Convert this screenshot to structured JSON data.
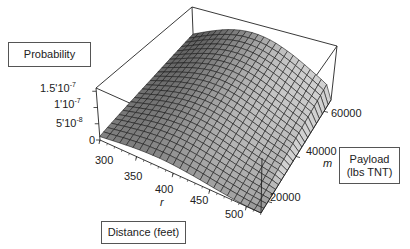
{
  "chart_data": {
    "type": "surface3d",
    "title": "",
    "xlabel": "Distance (feet)",
    "x_symbol": "r",
    "ylabel": "Payload (lbs TNT)",
    "y_symbol": "m",
    "zlabel": "Probability",
    "x_range": [
      300,
      520
    ],
    "y_range": [
      15000,
      65000
    ],
    "z_range": [
      0,
      1.6e-07
    ],
    "x_ticks": [
      300,
      350,
      400,
      450,
      500
    ],
    "y_ticks": [
      20000,
      40000,
      60000
    ],
    "z_ticks": [
      {
        "value": 0,
        "label": "0"
      },
      {
        "value": 5e-08,
        "label": "5'10",
        "exp": "-8"
      },
      {
        "value": 1e-07,
        "label": "1'10",
        "exp": "-7"
      },
      {
        "value": 1.5e-07,
        "label": "1.5'10",
        "exp": "-7"
      }
    ],
    "grid_resolution": [
      24,
      24
    ],
    "surface_description": "Dome-shaped probability surface; peaks near r≈380 ft at high payload (~1.4e-7), falls toward 0 at r=300 and r=520, lower at small payloads (~2e-8 at m=15000)",
    "sample_points": [
      {
        "r": 300,
        "m": 15000,
        "p": 1e-08
      },
      {
        "r": 380,
        "m": 15000,
        "p": 3.5e-08
      },
      {
        "r": 520,
        "m": 15000,
        "p": 0.0
      },
      {
        "r": 300,
        "m": 65000,
        "p": 6e-08
      },
      {
        "r": 380,
        "m": 65000,
        "p": 1.4e-07
      },
      {
        "r": 450,
        "m": 65000,
        "p": 1.2e-07
      },
      {
        "r": 520,
        "m": 65000,
        "p": 5.5e-08
      }
    ],
    "box": true,
    "grid": false,
    "legend": null
  },
  "labels": {
    "probability": "Probability",
    "distance": "Distance (feet)",
    "payload_line1": "Payload",
    "payload_line2": "(lbs TNT)",
    "r_symbol": "r",
    "m_symbol": "m"
  },
  "ticks": {
    "z": [
      {
        "base": "1.5'10",
        "exp": "-7"
      },
      {
        "base": "1'10",
        "exp": "-7"
      },
      {
        "base": "5'10",
        "exp": "-8"
      },
      {
        "base": "0",
        "exp": ""
      }
    ],
    "r": [
      "300",
      "350",
      "400",
      "450",
      "500"
    ],
    "m": [
      "20000",
      "40000",
      "60000"
    ]
  },
  "colors": {
    "surface_light": "#b8b8b8",
    "surface_dark": "#5a5a5a",
    "mesh": "#1a1a1a",
    "box": "#222222"
  }
}
